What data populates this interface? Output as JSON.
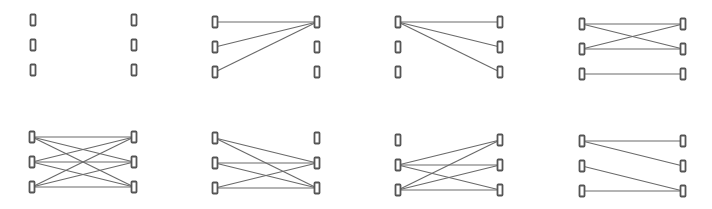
{
  "diagram": {
    "type": "bipartite-graph-grid",
    "colors": {
      "edge": "#6a6a6a",
      "node_stroke": "#555555",
      "node_fill": "#ffffff",
      "background": "#ffffff"
    },
    "node_size": {
      "w": 5,
      "h": 11
    },
    "row_offsets": [
      20,
      45,
      70
    ],
    "panels": [
      {
        "id": "top-1",
        "lx": 33,
        "rx": 134,
        "y0": 0,
        "edges": []
      },
      {
        "id": "top-2",
        "lx": 215,
        "rx": 317,
        "y0": 2,
        "edges": [
          [
            0,
            0
          ],
          [
            1,
            0
          ],
          [
            2,
            0
          ]
        ]
      },
      {
        "id": "top-3",
        "lx": 398,
        "rx": 500,
        "y0": 2,
        "edges": [
          [
            0,
            0
          ],
          [
            0,
            1
          ],
          [
            0,
            2
          ]
        ]
      },
      {
        "id": "top-4",
        "lx": 582,
        "rx": 683,
        "y0": 4,
        "edges": [
          [
            0,
            0
          ],
          [
            0,
            1
          ],
          [
            1,
            0
          ],
          [
            1,
            1
          ],
          [
            2,
            2
          ]
        ]
      },
      {
        "id": "bottom-1",
        "lx": 32,
        "rx": 134,
        "y0": 117,
        "edges": [
          [
            0,
            0
          ],
          [
            0,
            1
          ],
          [
            0,
            2
          ],
          [
            1,
            0
          ],
          [
            1,
            1
          ],
          [
            1,
            2
          ],
          [
            2,
            0
          ],
          [
            2,
            1
          ],
          [
            2,
            2
          ]
        ]
      },
      {
        "id": "bottom-2",
        "lx": 215,
        "rx": 317,
        "y0": 118,
        "edges": [
          [
            0,
            1
          ],
          [
            0,
            2
          ],
          [
            1,
            1
          ],
          [
            1,
            2
          ],
          [
            2,
            1
          ],
          [
            2,
            2
          ]
        ]
      },
      {
        "id": "bottom-3",
        "lx": 398,
        "rx": 500,
        "y0": 120,
        "edges": [
          [
            1,
            0
          ],
          [
            1,
            1
          ],
          [
            1,
            2
          ],
          [
            2,
            0
          ],
          [
            2,
            1
          ],
          [
            2,
            2
          ]
        ]
      },
      {
        "id": "bottom-4",
        "lx": 582,
        "rx": 683,
        "y0": 121,
        "edges": [
          [
            0,
            0
          ],
          [
            0,
            1
          ],
          [
            1,
            2
          ],
          [
            2,
            2
          ]
        ]
      }
    ]
  }
}
